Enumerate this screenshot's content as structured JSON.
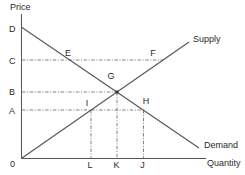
{
  "diagram": {
    "y_axis_title": "Price",
    "x_axis_title": "Quantity",
    "origin_label": "0",
    "curves": {
      "supply_label": "Supply",
      "demand_label": "Demand"
    },
    "y_ticks": {
      "d": "D",
      "c": "C",
      "b": "B",
      "a": "A"
    },
    "x_ticks": {
      "l": "L",
      "k": "K",
      "j": "J"
    },
    "points": {
      "e": "E",
      "f": "F",
      "g": "G",
      "i": "I",
      "h": "H"
    },
    "colors": {
      "curve": "#555555",
      "guide": "#6e6e6e",
      "text": "#2a2a2a",
      "background": "#ffffff"
    }
  }
}
